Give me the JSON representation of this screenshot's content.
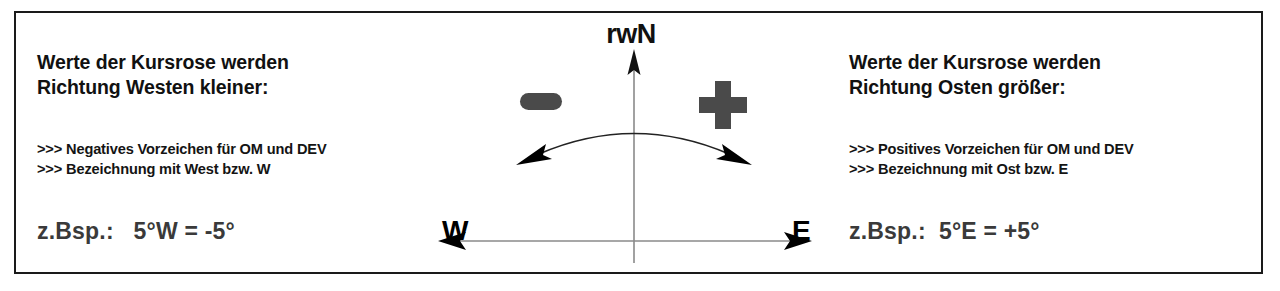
{
  "figure": {
    "border_color": "#1a1a1a",
    "background": "#ffffff"
  },
  "panels": {
    "west": {
      "heading": "Werte der Kursrose werden\nRichtung Westen kleiner:",
      "bullets": ">>> Negatives Vorzeichen für OM und DEV\n>>> Bezeichnung mit West bzw. W",
      "example": "z.Bsp.:   5°W = -5°"
    },
    "east": {
      "heading": "Werte der Kursrose werden\nRichtung Osten größer:",
      "bullets": ">>> Positives Vorzeichen für OM und DEV\n>>> Bezeichnung mit Ost bzw. E",
      "example": "z.Bsp.:  5°E = +5°"
    }
  },
  "diagram": {
    "north_label": "rwN",
    "west_label": "W",
    "east_label": "E",
    "minus_sign": "−",
    "plus_sign": "+",
    "sign_color": "#4a4a4a",
    "axis_color": "#8a8a8a",
    "arrowhead_color": "#000000"
  }
}
